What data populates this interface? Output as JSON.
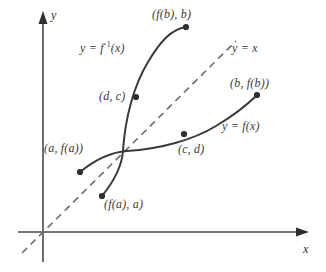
{
  "figure": {
    "type": "math-diagram",
    "background_color": "#ffffff",
    "curve_color": "#3a3a3a",
    "axis_color": "#4a4a4a",
    "label_color": "#3b3b3b",
    "dash_color": "#6b6b6b"
  },
  "axes": {
    "x_label": "x",
    "y_label": "y",
    "origin": {
      "x": 43,
      "y": 232
    }
  },
  "curves": [
    {
      "name": "function",
      "label": "y = f(x)",
      "label_pos": {
        "x": 222,
        "y": 120
      },
      "style": "solid"
    },
    {
      "name": "inverse-function",
      "label_prefix": "y = f",
      "label_exponent": "-1",
      "label_suffix": "(x)",
      "label_pos": {
        "x": 80,
        "y": 42
      },
      "style": "solid"
    },
    {
      "name": "identity-line",
      "label": "y = x",
      "label_pos": {
        "x": 232,
        "y": 42
      },
      "style": "dashed"
    }
  ],
  "points": [
    {
      "name": "f-b-b",
      "label": "(f(b), b)",
      "label_pos": {
        "x": 152,
        "y": 8
      },
      "dot": {
        "x": 186,
        "y": 27
      },
      "on_curve": "inverse-function"
    },
    {
      "name": "d-c",
      "label": "(d, c)",
      "label_pos": {
        "x": 99,
        "y": 90
      },
      "dot": {
        "x": 136,
        "y": 97
      },
      "on_curve": "inverse-function"
    },
    {
      "name": "a-fa",
      "label": "(a, f(a))",
      "label_pos": {
        "x": 44,
        "y": 142
      },
      "dot": {
        "x": 80,
        "y": 172
      },
      "on_curve": "function"
    },
    {
      "name": "f-a-a",
      "label": "(f(a), a)",
      "label_pos": {
        "x": 104,
        "y": 198
      },
      "dot": {
        "x": 102,
        "y": 196
      },
      "on_curve": "inverse-function"
    },
    {
      "name": "c-d",
      "label": "(c, d)",
      "label_pos": {
        "x": 178,
        "y": 143
      },
      "dot": {
        "x": 184,
        "y": 134
      },
      "on_curve": "function"
    },
    {
      "name": "b-fb",
      "label": "(b, f(b))",
      "label_pos": {
        "x": 230,
        "y": 77
      },
      "dot": {
        "x": 257,
        "y": 95
      },
      "on_curve": "function"
    }
  ]
}
